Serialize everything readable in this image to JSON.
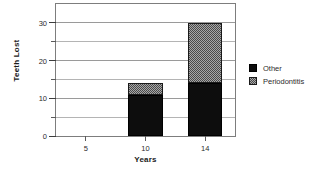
{
  "chart_data": {
    "type": "bar",
    "stacked": true,
    "title": "",
    "xlabel": "Years",
    "ylabel": "Teeth Lost",
    "categories": [
      "5",
      "10",
      "14"
    ],
    "x_tick_labels": [
      "5",
      "10",
      "14"
    ],
    "y_tick_labels": [
      "0",
      "10",
      "20",
      "30"
    ],
    "y_major_ticks": [
      0,
      10,
      20,
      30
    ],
    "y_minor_ticks": [
      5,
      15,
      25
    ],
    "ylim": [
      0,
      35
    ],
    "xlim": [
      0,
      3
    ],
    "grid": "horizontal",
    "legend_position": "right",
    "series": [
      {
        "name": "Other",
        "color": "#0d0d0d",
        "pattern": "solid",
        "values": [
          0,
          11,
          14
        ]
      },
      {
        "name": "Periodontitis",
        "color": "#a8a8a8",
        "pattern": "checker",
        "values": [
          0,
          3,
          16
        ]
      }
    ],
    "totals": [
      0,
      14,
      30
    ]
  },
  "axes": {
    "y_title": "Teeth Lost",
    "x_title": "Years"
  },
  "legend": {
    "items": [
      {
        "label": "Other"
      },
      {
        "label": "Periodontitis"
      }
    ]
  }
}
